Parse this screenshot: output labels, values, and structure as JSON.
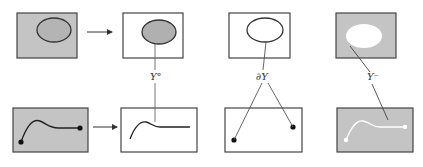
{
  "diagram": {
    "colors": {
      "shade": "#c4c4c4",
      "ellipse_fill": "#b4b4b4",
      "stroke": "#333333",
      "white": "#ffffff"
    },
    "labels": {
      "interior": "Y°",
      "boundary": "∂Y",
      "complement": "Y⁻"
    },
    "top_row": [
      {
        "id": "region",
        "background": "shaded",
        "ellipse": "shaded-outlined"
      },
      {
        "id": "interior",
        "background": "white",
        "ellipse": "shaded-outlined"
      },
      {
        "id": "boundary",
        "background": "white",
        "ellipse": "outline-only"
      },
      {
        "id": "complement",
        "background": "shaded",
        "ellipse": "white-no-outline"
      }
    ],
    "bottom_row": [
      {
        "id": "path",
        "background": "shaded",
        "curve": "dark",
        "endpoints": true
      },
      {
        "id": "path-in-interior",
        "background": "white",
        "curve": "dark",
        "endpoints": false
      },
      {
        "id": "path-endpoints",
        "background": "white",
        "curve": "none",
        "endpoints": true
      },
      {
        "id": "path-in-complement",
        "background": "shaded",
        "curve": "white",
        "endpoints": "white"
      }
    ],
    "arrows": [
      "top-arrow",
      "bottom-arrow"
    ]
  }
}
